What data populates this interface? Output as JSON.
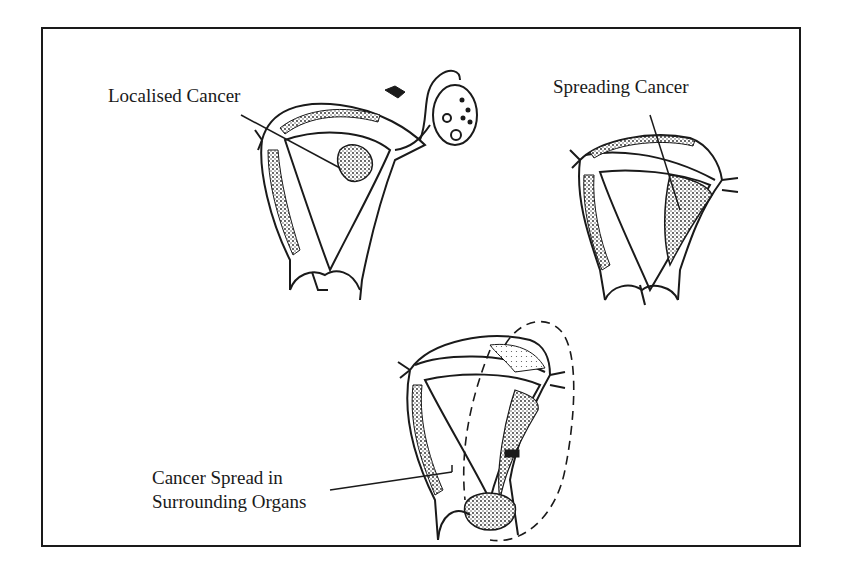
{
  "diagram": {
    "type": "medical-illustration",
    "colors": {
      "ink": "#1a1a1a",
      "background": "#ffffff"
    },
    "labels": {
      "localised": "Localised Cancer",
      "spreading": "Spreading Cancer",
      "surrounding_line1": "Cancer Spread in",
      "surrounding_line2": "Surrounding Organs"
    },
    "figures": [
      {
        "id": "localised",
        "label": "Localised Cancer",
        "position": "top-left"
      },
      {
        "id": "spreading",
        "label": "Spreading Cancer",
        "position": "top-right"
      },
      {
        "id": "surrounding",
        "label": "Cancer Spread in Surrounding Organs",
        "position": "bottom-center"
      }
    ]
  }
}
